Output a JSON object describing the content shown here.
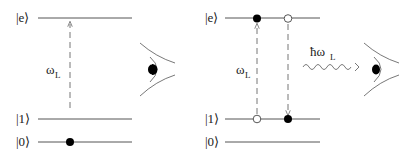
{
  "left_panel": {
    "levels": [
      {
        "label": "|e⟩",
        "y": 18
      },
      {
        "label": "|1⟩",
        "y": 119
      },
      {
        "label": "|0⟩",
        "y": 142
      }
    ],
    "transition_label": "ω",
    "transition_sub": "L",
    "particles": [
      {
        "level": "|0⟩",
        "x": 70,
        "filled": true
      }
    ],
    "observer": "eye-icon"
  },
  "right_panel": {
    "levels": [
      {
        "label": "|e⟩",
        "y": 18
      },
      {
        "label": "|1⟩",
        "y": 119
      },
      {
        "label": "|0⟩",
        "y": 142
      }
    ],
    "transition_label": "ω",
    "transition_sub": "L",
    "emission_label": "ħω",
    "emission_sub": "L",
    "particles": [
      {
        "level": "|e⟩",
        "x": 257,
        "filled": true
      },
      {
        "level": "|e⟩",
        "x": 288,
        "filled": false
      },
      {
        "level": "|1⟩",
        "x": 257,
        "filled": false
      },
      {
        "level": "|1⟩",
        "x": 288,
        "filled": true
      }
    ],
    "observer": "eye-icon"
  }
}
